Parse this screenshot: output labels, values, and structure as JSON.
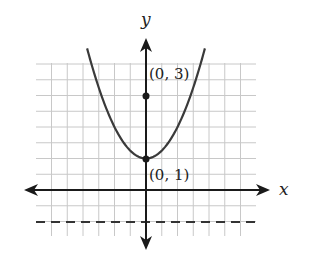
{
  "chart_data": {
    "type": "line",
    "title": "",
    "xlabel": "x",
    "ylabel": "y",
    "function": "y = x^2 + 1",
    "series": [
      {
        "name": "parabola",
        "x": [
          -1.87,
          -1.5,
          -1.0,
          -0.5,
          0,
          0.5,
          1.0,
          1.5,
          1.87
        ],
        "values": [
          4.5,
          3.25,
          2.0,
          1.25,
          1.0,
          1.25,
          2.0,
          3.25,
          4.5
        ]
      }
    ],
    "points": [
      {
        "x": 0,
        "y": 3,
        "label": "(0, 3)"
      },
      {
        "x": 0,
        "y": 1,
        "label": "(0, 1)"
      }
    ],
    "asymptote_dashed": {
      "y": -1
    },
    "xlim": [
      -3.5,
      3.5
    ],
    "ylim": [
      -1.5,
      4.5
    ],
    "grid": true,
    "grid_step": 0.5,
    "legend": null
  },
  "labels": {
    "x_axis": "x",
    "y_axis": "y",
    "point_top": "(0, 3)",
    "point_vertex": "(0, 1)"
  },
  "colors": {
    "grid": "#c8c8c8",
    "axis": "#1a1a1a",
    "curve": "#3a3a3a",
    "dashed": "#333333"
  }
}
